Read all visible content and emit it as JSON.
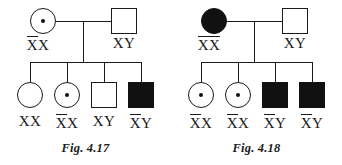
{
  "document": {
    "type": "pedigree-chart-pair",
    "background_color": "#ffffff",
    "ink_color": "#1a1a1a",
    "affected_fill": "#111111"
  },
  "figures": [
    {
      "id": "fig-4-17",
      "caption": "Fig. 4.17",
      "parents": [
        {
          "role": "mother",
          "sex": "female",
          "status": "carrier",
          "symbol": "circle-with-center-dot",
          "genotype": {
            "barred": "X",
            "plain": "X",
            "full": "XX"
          }
        },
        {
          "role": "father",
          "sex": "male",
          "status": "unaffected",
          "symbol": "open-square",
          "genotype": {
            "barred": "",
            "plain": "XY",
            "full": "XY"
          }
        }
      ],
      "offspring": [
        {
          "order": 1,
          "sex": "female",
          "status": "unaffected",
          "symbol": "open-circle",
          "genotype": {
            "barred": "",
            "plain": "XX",
            "full": "XX"
          }
        },
        {
          "order": 2,
          "sex": "female",
          "status": "carrier",
          "symbol": "circle-with-center-dot",
          "genotype": {
            "barred": "X",
            "plain": "X",
            "full": "XX"
          }
        },
        {
          "order": 3,
          "sex": "male",
          "status": "unaffected",
          "symbol": "open-square",
          "genotype": {
            "barred": "",
            "plain": "XY",
            "full": "XY"
          }
        },
        {
          "order": 4,
          "sex": "male",
          "status": "affected",
          "symbol": "filled-square",
          "genotype": {
            "barred": "X",
            "plain": "Y",
            "full": "XY"
          }
        }
      ]
    },
    {
      "id": "fig-4-18",
      "caption": "Fig. 4.18",
      "parents": [
        {
          "role": "mother",
          "sex": "female",
          "status": "affected",
          "symbol": "filled-circle",
          "genotype": {
            "barred": "XX",
            "plain": "",
            "full": "XX"
          }
        },
        {
          "role": "father",
          "sex": "male",
          "status": "unaffected",
          "symbol": "open-square",
          "genotype": {
            "barred": "",
            "plain": "XY",
            "full": "XY"
          }
        }
      ],
      "offspring": [
        {
          "order": 1,
          "sex": "female",
          "status": "carrier",
          "symbol": "circle-with-center-dot",
          "genotype": {
            "barred": "X",
            "plain": "X",
            "full": "XX"
          }
        },
        {
          "order": 2,
          "sex": "female",
          "status": "carrier",
          "symbol": "circle-with-center-dot",
          "genotype": {
            "barred": "X",
            "plain": "X",
            "full": "XX"
          }
        },
        {
          "order": 3,
          "sex": "male",
          "status": "affected",
          "symbol": "filled-square",
          "genotype": {
            "barred": "X",
            "plain": "Y",
            "full": "XY"
          }
        },
        {
          "order": 4,
          "sex": "male",
          "status": "affected",
          "symbol": "filled-square",
          "genotype": {
            "barred": "X",
            "plain": "Y",
            "full": "XY"
          }
        }
      ]
    }
  ]
}
